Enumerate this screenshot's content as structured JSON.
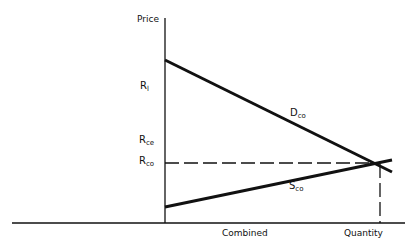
{
  "diagram": {
    "y_axis_label": "Price",
    "x_axis_label_left": "Combined",
    "x_axis_label_right": "Quantity",
    "price_labels": [
      {
        "main": "R",
        "sub": "l"
      },
      {
        "main": "R",
        "sub": "ce"
      },
      {
        "main": "R",
        "sub": "co"
      }
    ],
    "curves": {
      "demand": {
        "main": "D",
        "sub": "co"
      },
      "supply": {
        "main": "S",
        "sub": "co"
      }
    },
    "colors": {
      "line": "#111111",
      "background": "#ffffff"
    }
  }
}
